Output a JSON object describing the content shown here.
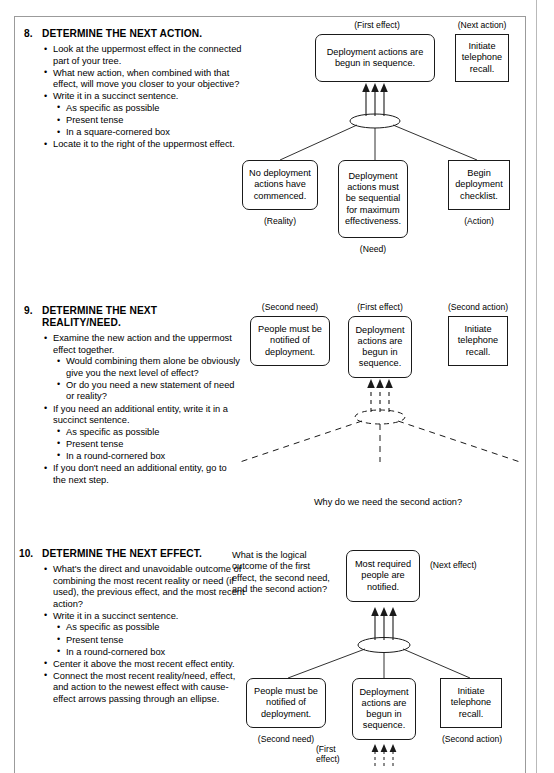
{
  "sections": [
    {
      "number": "8.",
      "title": "DETERMINE THE NEXT ACTION.",
      "bullets": [
        {
          "text": "Look at the uppermost effect in the connected part of your tree."
        },
        {
          "text": "What new action, when combined with that effect, will move you closer to your objective?"
        },
        {
          "text": "Write it in a succinct sentence.",
          "sub": [
            "As specific as possible",
            "Present tense",
            "In a square-cornered box"
          ]
        },
        {
          "text": "Locate it to the right of the uppermost effect."
        }
      ],
      "diagram": {
        "top_caption_left": "(First effect)",
        "top_caption_right": "(Next action)",
        "effect_box": "Deployment actions are begun in sequence.",
        "action_box": "Initiate telephone recall.",
        "bottom": [
          {
            "text": "No deployment actions have commenced.",
            "caption": "(Reality)",
            "shape": "round"
          },
          {
            "text": "Deployment actions must be sequential for maximum effectiveness.",
            "caption": "(Need)",
            "shape": "round"
          },
          {
            "text": "Begin deployment checklist.",
            "caption": "(Action)",
            "shape": "square"
          }
        ]
      }
    },
    {
      "number": "9.",
      "title": "DETERMINE THE NEXT REALITY/NEED.",
      "bullets": [
        {
          "text": "Examine the new action and the uppermost effect together.",
          "sub": [
            "Would combining them alone be obviously give you the next level of effect?",
            "Or do you need a new statement of need or reality?"
          ]
        },
        {
          "text": "If you need an additional entity, write it in a succinct sentence.",
          "sub": [
            "As specific as possible",
            "Present tense",
            "In a round-cornered box"
          ]
        },
        {
          "text": "If you don't need an additional entity, go to the next step."
        }
      ],
      "diagram": {
        "caption_need": "(Second need)",
        "caption_effect": "(First effect)",
        "caption_action": "(Second action)",
        "need_box": "People must be notified of deployment.",
        "effect_box": "Deployment actions are begun in sequence.",
        "action_box": "Initiate telephone recall.",
        "question": "Why do we need the second action?"
      }
    },
    {
      "number": "10.",
      "title": "DETERMINE THE NEXT EFFECT.",
      "bullets": [
        {
          "text": "What's the direct and unavoidable outcome of combining the most recent reality or need (if used), the previous effect, and the most recent action?"
        },
        {
          "text": "Write it in a succinct sentence.",
          "sub": [
            "As specific as possible",
            "Present tense",
            "In a round-cornered box"
          ]
        },
        {
          "text": "Center it above the most recent effect entity."
        },
        {
          "text": "Connect the most recent reality/need, effect, and action to the newest effect with cause-effect arrows passing through an ellipse."
        }
      ],
      "diagram": {
        "question": "What is the logical outcome of the first effect, the second need, and the second action?",
        "top_box": "Most required people are notified.",
        "caption_next_effect": "(Next effect)",
        "bottom": [
          {
            "text": "People must be notified of deployment.",
            "caption": "(Second need)",
            "shape": "round"
          },
          {
            "text": "Deployment actions are begun in sequence.",
            "caption": "(First effect)",
            "shape": "round"
          },
          {
            "text": "Initiate telephone recall.",
            "caption": "(Second action)",
            "shape": "square"
          }
        ]
      }
    }
  ]
}
